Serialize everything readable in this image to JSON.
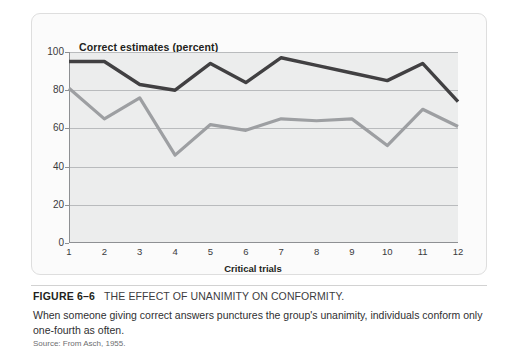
{
  "chart_data": {
    "type": "line",
    "title": "Correct estimates (percent)",
    "xlabel": "Critical trials",
    "ylabel": "Correct estimates (percent)",
    "categories": [
      "1",
      "2",
      "3",
      "4",
      "5",
      "6",
      "7",
      "8",
      "9",
      "10",
      "11",
      "12"
    ],
    "x": [
      1,
      2,
      3,
      4,
      5,
      6,
      7,
      8,
      9,
      10,
      11,
      12
    ],
    "ylim": [
      0,
      100
    ],
    "xlim": [
      1,
      12
    ],
    "yticks": [
      0,
      20,
      40,
      60,
      80,
      100
    ],
    "ytick_labels": [
      "0",
      "20",
      "40",
      "60",
      "80",
      "100"
    ],
    "grid": true,
    "legend": "none",
    "series": [
      {
        "name": "dark-line",
        "color": "#414042",
        "values": [
          95,
          95,
          83,
          80,
          94,
          84,
          97,
          93,
          89,
          85,
          94,
          74
        ]
      },
      {
        "name": "grey-line",
        "color": "#9d9fa2",
        "values": [
          81,
          65,
          76,
          46,
          62,
          59,
          65,
          64,
          65,
          51,
          70,
          61
        ]
      }
    ],
    "plot_background": "#eceded",
    "gridline_color": "#b9bbbd",
    "axis_color": "#8e9093"
  },
  "figure": {
    "number_label": "FIGURE 6–6",
    "title": "THE EFFECT OF UNANIMITY ON CONFORMITY.",
    "body": "When someone giving correct answers punctures the group's  unanimity, individuals conform only one-fourth as often.",
    "source": "Source: From Asch, 1955."
  }
}
